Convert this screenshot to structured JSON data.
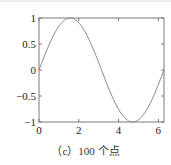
{
  "chart_data": {
    "type": "line",
    "title": "",
    "caption": "（c）100 个点",
    "xlabel": "",
    "ylabel": "",
    "xlim": [
      0,
      6.2832
    ],
    "ylim": [
      -1,
      1
    ],
    "xticks": [
      0,
      2,
      4,
      6
    ],
    "xtick_labels": [
      "0",
      "2",
      "4",
      "6"
    ],
    "yticks": [
      1,
      0.5,
      0,
      -0.5,
      -1
    ],
    "ytick_labels": [
      "1",
      "0.5",
      "0",
      "−0.5",
      "−1"
    ],
    "grid": false,
    "legend": null,
    "series": [
      {
        "name": "sin(x)",
        "function": "y = sin(x)",
        "num_points": 100,
        "x_range": [
          0,
          6.2832
        ],
        "sample_points": [
          {
            "x": 0,
            "y": 0
          },
          {
            "x": 0.785,
            "y": 0.707
          },
          {
            "x": 1.571,
            "y": 1
          },
          {
            "x": 2.356,
            "y": 0.707
          },
          {
            "x": 3.142,
            "y": 0
          },
          {
            "x": 3.927,
            "y": -0.707
          },
          {
            "x": 4.712,
            "y": -1
          },
          {
            "x": 5.498,
            "y": -0.707
          },
          {
            "x": 6.283,
            "y": 0
          }
        ],
        "color": "#8a8a8a"
      }
    ]
  },
  "colors": {
    "axes": "#7a7a7a",
    "line": "#8a8a8a",
    "text": "#222222"
  }
}
